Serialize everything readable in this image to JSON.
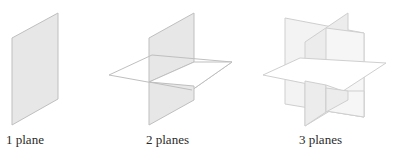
{
  "figure": {
    "panels": [
      {
        "label": "1 plane",
        "plane_count": 1
      },
      {
        "label": "2 planes",
        "plane_count": 2
      },
      {
        "label": "3 planes",
        "plane_count": 3
      }
    ]
  },
  "colors": {
    "plane_fill_shaded": "#e6e6e6",
    "plane_fill_light": "#f2f2f2",
    "plane_fill_white": "#ffffff",
    "plane_edge": "#bdbdbd",
    "label_text": "#2a2a2a"
  }
}
